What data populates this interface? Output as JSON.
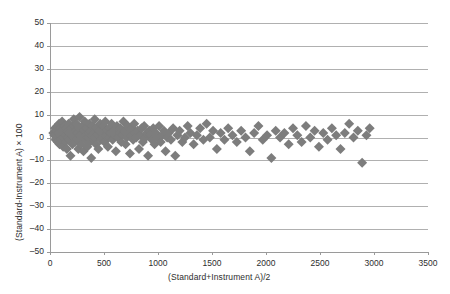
{
  "chart_data": {
    "type": "scatter",
    "title": "",
    "subtitle": "",
    "xlabel": "(Standard+Instrument A)/2",
    "ylabel": "(Standard-Instrument A) × 100",
    "xlim": [
      0,
      3500
    ],
    "ylim": [
      -50,
      50
    ],
    "xticks": [
      0,
      500,
      1000,
      1500,
      2000,
      2500,
      3000,
      3500
    ],
    "yticks": [
      -50,
      -40,
      -30,
      -20,
      -10,
      0,
      10,
      20,
      30,
      40,
      50
    ],
    "xtick_labels": [
      "0",
      "500",
      "1000",
      "1500",
      "2000",
      "2500",
      "3000",
      "3500"
    ],
    "ytick_labels": [
      "-50",
      "-40",
      "-30",
      "-20",
      "-10",
      "0",
      "10",
      "20",
      "30",
      "40",
      "50"
    ],
    "grid": "horizontal",
    "legend": "none",
    "marker": "diamond",
    "marker_color": "#7d7d7d",
    "marker_size": 5,
    "gridline_color": "#b0b0b0",
    "axis_color": "#9a9a9a",
    "background": "#ffffff",
    "series": [
      {
        "name": "Standard vs Instrument A difference",
        "points": [
          [
            30,
            2
          ],
          [
            40,
            1
          ],
          [
            45,
            4
          ],
          [
            52,
            -1
          ],
          [
            58,
            3
          ],
          [
            62,
            0
          ],
          [
            68,
            5
          ],
          [
            72,
            -2
          ],
          [
            78,
            2
          ],
          [
            84,
            6
          ],
          [
            88,
            -3
          ],
          [
            92,
            1
          ],
          [
            96,
            4
          ],
          [
            102,
            -1
          ],
          [
            108,
            3
          ],
          [
            112,
            7
          ],
          [
            118,
            0
          ],
          [
            122,
            -4
          ],
          [
            128,
            2
          ],
          [
            134,
            5
          ],
          [
            140,
            -2
          ],
          [
            146,
            1
          ],
          [
            150,
            4
          ],
          [
            156,
            -5
          ],
          [
            162,
            3
          ],
          [
            168,
            0
          ],
          [
            172,
            6
          ],
          [
            178,
            -1
          ],
          [
            184,
            2
          ],
          [
            190,
            -8
          ],
          [
            196,
            4
          ],
          [
            202,
            1
          ],
          [
            208,
            -3
          ],
          [
            214,
            5
          ],
          [
            220,
            8
          ],
          [
            226,
            0
          ],
          [
            232,
            -2
          ],
          [
            238,
            3
          ],
          [
            244,
            6
          ],
          [
            250,
            -1
          ],
          [
            256,
            2
          ],
          [
            262,
            -5
          ],
          [
            268,
            4
          ],
          [
            274,
            9
          ],
          [
            280,
            1
          ],
          [
            286,
            -3
          ],
          [
            292,
            0
          ],
          [
            298,
            5
          ],
          [
            304,
            2
          ],
          [
            310,
            -6
          ],
          [
            316,
            3
          ],
          [
            322,
            7
          ],
          [
            328,
            -1
          ],
          [
            334,
            1
          ],
          [
            340,
            4
          ],
          [
            346,
            -4
          ],
          [
            352,
            0
          ],
          [
            358,
            2
          ],
          [
            364,
            6
          ],
          [
            370,
            -2
          ],
          [
            376,
            3
          ],
          [
            382,
            -9
          ],
          [
            390,
            1
          ],
          [
            396,
            5
          ],
          [
            402,
            -1
          ],
          [
            408,
            2
          ],
          [
            414,
            8
          ],
          [
            420,
            0
          ],
          [
            426,
            -3
          ],
          [
            432,
            4
          ],
          [
            440,
            1
          ],
          [
            448,
            -5
          ],
          [
            456,
            3
          ],
          [
            464,
            6
          ],
          [
            472,
            -1
          ],
          [
            480,
            2
          ],
          [
            488,
            0
          ],
          [
            496,
            5
          ],
          [
            504,
            -2
          ],
          [
            512,
            7
          ],
          [
            520,
            1
          ],
          [
            528,
            3
          ],
          [
            536,
            -4
          ],
          [
            544,
            0
          ],
          [
            552,
            4
          ],
          [
            560,
            2
          ],
          [
            570,
            6
          ],
          [
            580,
            -1
          ],
          [
            590,
            3
          ],
          [
            600,
            1
          ],
          [
            610,
            -6
          ],
          [
            620,
            5
          ],
          [
            630,
            0
          ],
          [
            640,
            2
          ],
          [
            650,
            4
          ],
          [
            660,
            -2
          ],
          [
            670,
            1
          ],
          [
            680,
            7
          ],
          [
            690,
            3
          ],
          [
            700,
            -3
          ],
          [
            710,
            0
          ],
          [
            720,
            5
          ],
          [
            730,
            2
          ],
          [
            740,
            -7
          ],
          [
            750,
            1
          ],
          [
            760,
            4
          ],
          [
            770,
            -1
          ],
          [
            780,
            6
          ],
          [
            790,
            2
          ],
          [
            800,
            0
          ],
          [
            812,
            3
          ],
          [
            824,
            -5
          ],
          [
            836,
            1
          ],
          [
            848,
            4
          ],
          [
            860,
            -2
          ],
          [
            872,
            5
          ],
          [
            884,
            0
          ],
          [
            896,
            2
          ],
          [
            908,
            -8
          ],
          [
            920,
            3
          ],
          [
            932,
            1
          ],
          [
            944,
            -1
          ],
          [
            956,
            4
          ],
          [
            968,
            -3
          ],
          [
            980,
            2
          ],
          [
            995,
            0
          ],
          [
            1010,
            5
          ],
          [
            1025,
            -2
          ],
          [
            1040,
            1
          ],
          [
            1055,
            3
          ],
          [
            1070,
            -6
          ],
          [
            1085,
            0
          ],
          [
            1100,
            2
          ],
          [
            1120,
            -1
          ],
          [
            1140,
            4
          ],
          [
            1160,
            -8
          ],
          [
            1180,
            1
          ],
          [
            1200,
            3
          ],
          [
            1225,
            -2
          ],
          [
            1250,
            0
          ],
          [
            1275,
            5
          ],
          [
            1300,
            2
          ],
          [
            1330,
            -3
          ],
          [
            1360,
            1
          ],
          [
            1390,
            4
          ],
          [
            1420,
            -1
          ],
          [
            1450,
            6
          ],
          [
            1480,
            0
          ],
          [
            1510,
            3
          ],
          [
            1545,
            -5
          ],
          [
            1580,
            2
          ],
          [
            1615,
            -1
          ],
          [
            1650,
            4
          ],
          [
            1690,
            1
          ],
          [
            1730,
            -2
          ],
          [
            1770,
            3
          ],
          [
            1810,
            0
          ],
          [
            1850,
            -6
          ],
          [
            1890,
            2
          ],
          [
            1930,
            5
          ],
          [
            1970,
            -1
          ],
          [
            2010,
            1
          ],
          [
            2050,
            -9
          ],
          [
            2090,
            3
          ],
          [
            2130,
            0
          ],
          [
            2170,
            2
          ],
          [
            2210,
            -3
          ],
          [
            2250,
            4
          ],
          [
            2290,
            1
          ],
          [
            2330,
            -2
          ],
          [
            2370,
            5
          ],
          [
            2410,
            0
          ],
          [
            2450,
            3
          ],
          [
            2490,
            -4
          ],
          [
            2530,
            2
          ],
          [
            2570,
            -1
          ],
          [
            2610,
            4
          ],
          [
            2650,
            1
          ],
          [
            2690,
            -5
          ],
          [
            2730,
            2
          ],
          [
            2770,
            6
          ],
          [
            2810,
            0
          ],
          [
            2850,
            3
          ],
          [
            2890,
            -11
          ],
          [
            2930,
            1
          ],
          [
            2960,
            4
          ]
        ]
      }
    ]
  },
  "plot_geometry": {
    "left": 50,
    "right": 428,
    "top": 23,
    "bottom": 252
  }
}
